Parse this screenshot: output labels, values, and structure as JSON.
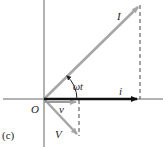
{
  "figure": {
    "panel_label": "(c)",
    "origin_label": "O",
    "phasors": {
      "I": "I",
      "i": "i",
      "V": "V",
      "v": "v"
    },
    "angle_label": "ωt",
    "colors": {
      "axis": "#555555",
      "phasor": "#a6a6a6",
      "projection": "#111111",
      "dashed": "#444444"
    }
  }
}
